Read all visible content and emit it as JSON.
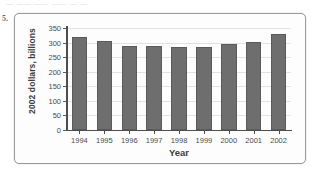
{
  "item_number": "5.",
  "scan_artifact_text": "— —— —— —— — —",
  "colors": {
    "bar_fill": "#6e6e6e",
    "bar_border": "#5a5a5a",
    "axis": "#4d4d4d",
    "gridline": "#e2e2e2",
    "frame_border": "#9a9a9a",
    "plot_background": "#fdfdfd",
    "text": "#3c3c3c"
  },
  "chart_data": {
    "type": "bar",
    "title": "",
    "subtitle": "",
    "xlabel": "Year",
    "ylabel": "2002 dollars, billions",
    "categories": [
      "1994",
      "1995",
      "1996",
      "1997",
      "1998",
      "1999",
      "2000",
      "2001",
      "2002"
    ],
    "values": [
      320,
      305,
      288,
      288,
      285,
      285,
      295,
      301,
      331
    ],
    "series": [
      {
        "name": "2002 dollars, billions",
        "values": [
          320,
          305,
          288,
          288,
          285,
          285,
          295,
          301,
          331
        ]
      }
    ],
    "ylim": [
      0,
      350
    ],
    "xlim_categories": 9,
    "y_ticks": [
      0,
      50,
      100,
      150,
      200,
      250,
      300,
      350
    ],
    "y_tick_labels": [
      "0",
      "50",
      "100",
      "150",
      "200",
      "250",
      "300",
      "350"
    ],
    "x_tick_labels": [
      "1994",
      "1995",
      "1996",
      "1997",
      "1998",
      "1999",
      "2000",
      "2001",
      "2002"
    ],
    "grid": true,
    "grid_axis": "y",
    "legend": false,
    "legend_position": "none",
    "annotations": [],
    "bar_orientation": "vertical"
  }
}
